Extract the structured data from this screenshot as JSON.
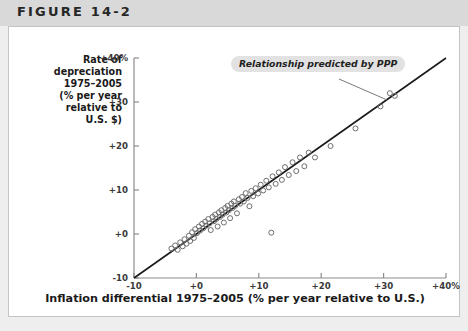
{
  "header": {
    "figure_label": "FIGURE 14-2"
  },
  "chart_data": {
    "type": "scatter",
    "title": "FIGURE 14-2",
    "xlabel": "Inflation differential 1975–2005 (% per year relative to U.S.)",
    "ylabel": "Rate of depreciation 1975–2005 (% per year relative to U.S. $)",
    "xlim": [
      -10,
      40
    ],
    "ylim": [
      -10,
      40
    ],
    "grid": false,
    "legend": "none",
    "xticks": [
      -10,
      0,
      10,
      20,
      30,
      40
    ],
    "yticks": [
      -10,
      0,
      10,
      20,
      30,
      40
    ],
    "xticklabels": [
      "-10",
      "+0",
      "+10",
      "+20",
      "+30",
      "+40%"
    ],
    "yticklabels": [
      "-10",
      "+0",
      "+10",
      "+20",
      "+30",
      "+40%"
    ],
    "annotations": [
      {
        "text": "Relationship predicted by PPP",
        "x": 19.5,
        "y": 37.5,
        "points_to_x": 30.5,
        "points_to_y": 30.5
      }
    ],
    "reference_line": {
      "label": "Relationship predicted by PPP",
      "slope": 1,
      "intercept": 0,
      "from": [
        -10,
        -10
      ],
      "to": [
        40,
        40
      ]
    },
    "points": [
      [
        -4.0,
        -3.3
      ],
      [
        -3.4,
        -2.6
      ],
      [
        -3.0,
        -3.6
      ],
      [
        -2.6,
        -1.9
      ],
      [
        -2.2,
        -2.8
      ],
      [
        -1.9,
        -1.2
      ],
      [
        -1.6,
        -2.2
      ],
      [
        -1.2,
        -0.4
      ],
      [
        -1.0,
        -1.6
      ],
      [
        -0.7,
        0.4
      ],
      [
        -0.4,
        -0.9
      ],
      [
        -0.2,
        1.1
      ],
      [
        0.1,
        0.2
      ],
      [
        0.4,
        1.7
      ],
      [
        0.6,
        0.8
      ],
      [
        0.9,
        2.3
      ],
      [
        1.1,
        1.3
      ],
      [
        1.4,
        2.8
      ],
      [
        1.6,
        1.9
      ],
      [
        1.9,
        3.4
      ],
      [
        2.1,
        2.4
      ],
      [
        2.3,
        0.9
      ],
      [
        2.6,
        3.9
      ],
      [
        2.8,
        2.9
      ],
      [
        3.0,
        4.4
      ],
      [
        3.2,
        3.4
      ],
      [
        3.4,
        1.7
      ],
      [
        3.6,
        4.9
      ],
      [
        3.8,
        3.9
      ],
      [
        4.0,
        5.4
      ],
      [
        4.2,
        4.4
      ],
      [
        4.4,
        2.6
      ],
      [
        4.6,
        5.9
      ],
      [
        4.8,
        4.9
      ],
      [
        5.0,
        6.4
      ],
      [
        5.2,
        5.4
      ],
      [
        5.4,
        3.6
      ],
      [
        5.6,
        6.9
      ],
      [
        5.8,
        5.9
      ],
      [
        6.0,
        7.4
      ],
      [
        6.2,
        6.4
      ],
      [
        6.5,
        4.7
      ],
      [
        6.8,
        7.9
      ],
      [
        7.0,
        6.9
      ],
      [
        7.3,
        8.4
      ],
      [
        7.6,
        7.4
      ],
      [
        7.9,
        9.3
      ],
      [
        8.2,
        8.2
      ],
      [
        8.5,
        6.3
      ],
      [
        8.8,
        9.8
      ],
      [
        9.1,
        8.6
      ],
      [
        9.5,
        10.4
      ],
      [
        9.9,
        9.2
      ],
      [
        10.3,
        11.2
      ],
      [
        10.7,
        9.9
      ],
      [
        11.2,
        12.1
      ],
      [
        11.6,
        10.6
      ],
      [
        12.0,
        0.3
      ],
      [
        12.2,
        13.1
      ],
      [
        12.7,
        11.4
      ],
      [
        13.2,
        14.0
      ],
      [
        13.7,
        12.3
      ],
      [
        14.2,
        15.2
      ],
      [
        14.8,
        13.4
      ],
      [
        15.4,
        16.3
      ],
      [
        16.0,
        14.3
      ],
      [
        16.6,
        17.4
      ],
      [
        17.3,
        15.4
      ],
      [
        18.0,
        18.5
      ],
      [
        19.0,
        17.4
      ],
      [
        21.5,
        20.0
      ],
      [
        25.5,
        24.0
      ],
      [
        29.5,
        29.0
      ],
      [
        31.0,
        32.0
      ],
      [
        31.8,
        31.4
      ]
    ]
  }
}
